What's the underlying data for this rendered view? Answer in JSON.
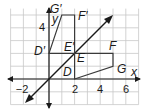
{
  "figure": {
    "type": "coordinate-plane-transformation",
    "axes": {
      "x_label": "x",
      "y_label": "y",
      "x_ticks": [
        {
          "value": -2,
          "label": "−2"
        },
        {
          "value": 2,
          "label": "2"
        },
        {
          "value": 4,
          "label": "4"
        },
        {
          "value": 6,
          "label": "6"
        }
      ],
      "y_ticks": [
        {
          "value": 4,
          "label": "4"
        }
      ],
      "grid": {
        "x_min": -3,
        "x_max": 7,
        "y_min": -2,
        "y_max": 5.5,
        "step": 1
      }
    },
    "reflection_line": {
      "equation": "y = x",
      "color": "#1a1a1a"
    },
    "original_polygon": {
      "vertices": [
        {
          "name": "D",
          "label": "D",
          "x": 2,
          "y": 0
        },
        {
          "name": "E",
          "label": "E",
          "x": 2,
          "y": 2
        },
        {
          "name": "F",
          "label": "F",
          "x": 5,
          "y": 2
        },
        {
          "name": "G",
          "label": "G",
          "x": 5,
          "y": 1
        }
      ]
    },
    "image_polygon": {
      "vertices": [
        {
          "name": "D'",
          "label": "D′",
          "x": 0,
          "y": 2
        },
        {
          "name": "E'",
          "label": "E′",
          "x": 2,
          "y": 2
        },
        {
          "name": "F'",
          "label": "F′",
          "x": 2,
          "y": 5
        },
        {
          "name": "G'",
          "label": "G′",
          "x": 1,
          "y": 5
        }
      ]
    },
    "colors": {
      "grid": "#c8c8c8",
      "axis": "#1a1a1a",
      "polygon": "#3a3a3a",
      "background": "#ffffff"
    }
  }
}
